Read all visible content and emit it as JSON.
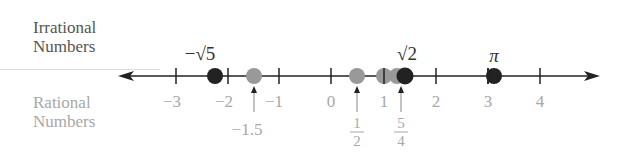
{
  "labels": {
    "irrational": [
      "Irrational",
      "Numbers"
    ],
    "rational": [
      "Rational",
      "Numbers"
    ]
  },
  "axis": {
    "min": -3,
    "max": 4,
    "ticks": [
      -3,
      -2,
      -1,
      0,
      1,
      2,
      3,
      4
    ],
    "tick_labels": [
      "−3",
      "−2",
      "−1",
      "0",
      "1",
      "2",
      "3",
      "4"
    ]
  },
  "irrational_points": [
    {
      "value": -2.236,
      "label": "−√5"
    },
    {
      "value": 1.414,
      "label": "√2"
    },
    {
      "value": 3.1416,
      "label": "π"
    }
  ],
  "rational_points": [
    {
      "value": -1.5,
      "label": "−1.5"
    },
    {
      "value": 0.5,
      "label_num": "1",
      "label_den": "2"
    },
    {
      "value": 1,
      "label": "1"
    },
    {
      "value": 1.25,
      "label_num": "5",
      "label_den": "4"
    }
  ],
  "colors": {
    "irrational": "#222222",
    "rational": "#999999",
    "axis": "#222222",
    "rational_text": "#a8a8a8"
  }
}
